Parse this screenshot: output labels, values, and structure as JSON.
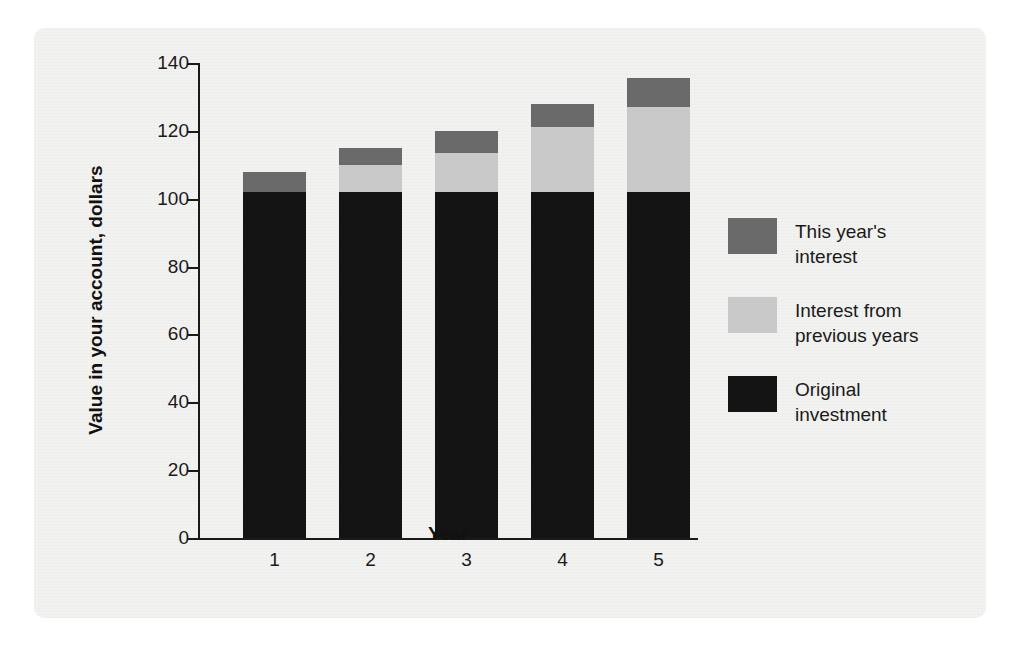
{
  "chart_data": {
    "type": "bar",
    "subtype": "stacked-bar",
    "title": "",
    "xlabel": "Year",
    "ylabel": "Value in your account, dollars",
    "categories": [
      "1",
      "2",
      "3",
      "4",
      "5"
    ],
    "x_tick_labels": [
      "1",
      "2",
      "3",
      "4",
      "5"
    ],
    "y_tick_labels": [
      "0",
      "20",
      "40",
      "60",
      "80",
      "100",
      "120",
      "140"
    ],
    "y_ticks": [
      0,
      20,
      40,
      60,
      80,
      100,
      120,
      140
    ],
    "ylim": [
      0,
      140
    ],
    "grid": false,
    "legend_position": "right",
    "series": [
      {
        "name": "Original investment",
        "color": "#141414",
        "values": [
          102,
          102,
          102,
          102,
          102
        ]
      },
      {
        "name": "Interest from previous years",
        "color": "#c9c9c9",
        "values": [
          0,
          8,
          11.5,
          19,
          25
        ]
      },
      {
        "name": "This year's interest",
        "color": "#6a6a6a",
        "values": [
          6,
          5,
          6.5,
          7,
          8.5
        ]
      }
    ],
    "totals": [
      108,
      115,
      120,
      128,
      135.5
    ]
  },
  "axes": {
    "y": {
      "label": "Value in your account, dollars",
      "ticks": [
        {
          "value": 140,
          "label": "140"
        },
        {
          "value": 120,
          "label": "120"
        },
        {
          "value": 100,
          "label": "100"
        },
        {
          "value": 80,
          "label": "80"
        },
        {
          "value": 60,
          "label": "60"
        },
        {
          "value": 40,
          "label": "40"
        },
        {
          "value": 20,
          "label": "20"
        },
        {
          "value": 0,
          "label": "0"
        }
      ]
    },
    "x": {
      "label": "Year",
      "ticks": [
        {
          "label": "1"
        },
        {
          "label": "2"
        },
        {
          "label": "3"
        },
        {
          "label": "4"
        },
        {
          "label": "5"
        }
      ]
    }
  },
  "legend": {
    "items": [
      {
        "label_line1": "This year's",
        "label_line2": "interest",
        "color": "#6a6a6a"
      },
      {
        "label_line1": "Interest from",
        "label_line2": "previous years",
        "color": "#c9c9c9"
      },
      {
        "label_line1": "Original",
        "label_line2": "investment",
        "color": "#141414"
      }
    ]
  },
  "colors": {
    "this_year_interest": "#6a6a6a",
    "previous_interest": "#c9c9c9",
    "original_investment": "#141414",
    "axis": "#1a1a1a",
    "panel_background": "#f2f2f0"
  }
}
